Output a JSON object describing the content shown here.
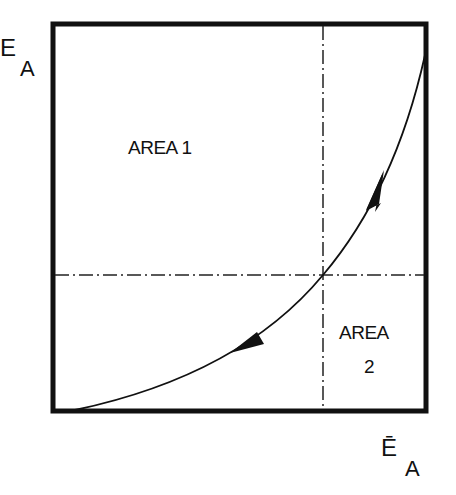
{
  "diagram": {
    "y_axis_label": {
      "main": "E",
      "subscript": "A"
    },
    "x_axis_label": {
      "main": "Ē",
      "subscript": "A"
    },
    "regions": [
      {
        "label": "AREA 1"
      },
      {
        "label_line1": "AREA",
        "label_line2": "2"
      }
    ],
    "elements": {
      "frame": "square box",
      "curve": "convex curve from bottom-left to top-right with two arrows (up-right and down-left)",
      "reference_lines": [
        "vertical dash-dot line",
        "horizontal dash-dot line"
      ]
    },
    "colors": {
      "line": "#111111",
      "background": "#ffffff"
    }
  }
}
